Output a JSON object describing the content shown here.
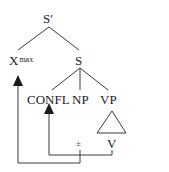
{
  "tree": {
    "root": {
      "label": "S′"
    },
    "xmax": {
      "label": "X",
      "superscript": "max"
    },
    "s": {
      "label": "S"
    },
    "confl": {
      "label": "CONFL"
    },
    "np": {
      "label": "NP"
    },
    "vp": {
      "label": "VP"
    },
    "v": {
      "label": "V"
    },
    "trace": {
      "label": "±"
    }
  },
  "arrows": [
    {
      "name": "movement-to-xmax",
      "from": "trace",
      "to": "xmax"
    },
    {
      "name": "movement-to-confl",
      "from": "v",
      "to": "confl"
    }
  ],
  "colors": {
    "line": "#333333",
    "text": "#1a1a1a"
  }
}
